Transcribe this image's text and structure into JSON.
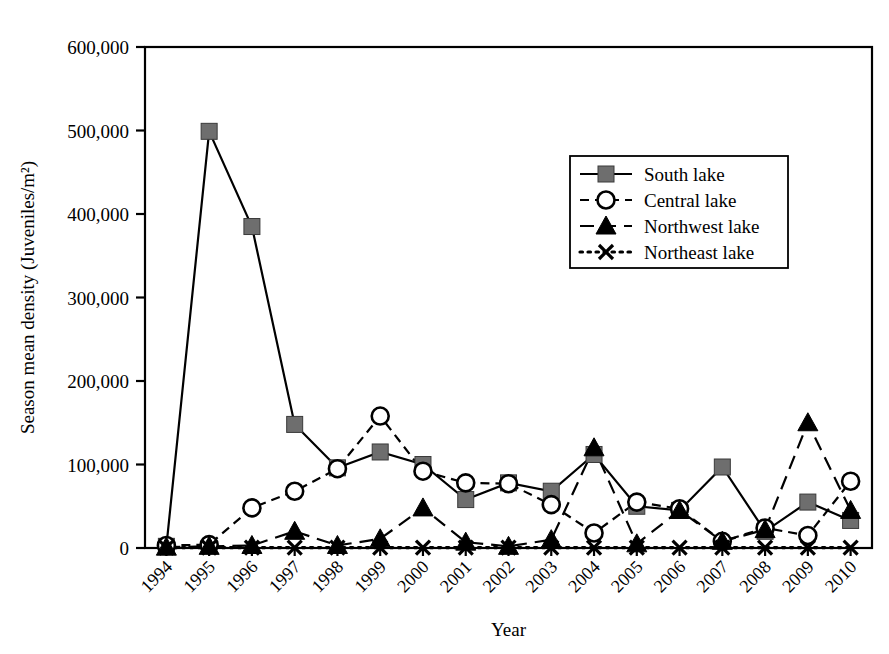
{
  "chart_data": {
    "type": "line",
    "title": "",
    "xlabel": "Year",
    "ylabel": "Season mean density (Juveniles/m²)",
    "categories": [
      "1994",
      "1995",
      "1996",
      "1997",
      "1998",
      "1999",
      "2000",
      "2001",
      "2002",
      "2003",
      "2004",
      "2005",
      "2006",
      "2007",
      "2008",
      "2009",
      "2010"
    ],
    "ylim": [
      0,
      600000
    ],
    "yticks": [
      0,
      100000,
      200000,
      300000,
      400000,
      500000,
      600000
    ],
    "ytick_labels": [
      "0",
      "100,000",
      "200,000",
      "300,000",
      "400,000",
      "500,000",
      "600,000"
    ],
    "grid": false,
    "legend_position": "upper-right-inside",
    "series": [
      {
        "name": "South lake",
        "marker": "filled-square",
        "marker_color": "#6e6e6e",
        "line_style": "solid",
        "line_color": "#000000",
        "values": [
          2000,
          499000,
          385000,
          148000,
          96000,
          115000,
          100000,
          58000,
          78000,
          68000,
          112000,
          50000,
          45000,
          97000,
          20000,
          55000,
          33000
        ]
      },
      {
        "name": "Central lake",
        "marker": "open-circle",
        "marker_color": "#ffffff",
        "line_style": "dashed",
        "line_color": "#000000",
        "values": [
          3000,
          4000,
          48000,
          68000,
          95000,
          158000,
          92000,
          78000,
          77000,
          52000,
          18000,
          55000,
          47000,
          8000,
          24000,
          15000,
          80000
        ]
      },
      {
        "name": "Northwest lake",
        "marker": "filled-triangle",
        "marker_color": "#000000",
        "line_style": "long-dashed",
        "line_color": "#000000",
        "values": [
          1000,
          2000,
          3000,
          20000,
          3000,
          11000,
          48000,
          7000,
          2000,
          10000,
          120000,
          5000,
          45000,
          8000,
          22000,
          150000,
          45000
        ]
      },
      {
        "name": "Northeast lake",
        "marker": "x-cross",
        "marker_color": "#000000",
        "line_style": "dotted",
        "line_color": "#000000",
        "values": [
          500,
          500,
          500,
          500,
          500,
          500,
          500,
          500,
          500,
          500,
          500,
          500,
          500,
          500,
          500,
          500,
          500
        ]
      }
    ]
  },
  "figure": {
    "plot_left": 145,
    "plot_right": 872,
    "plot_top": 47,
    "plot_bottom": 548,
    "frame_color": "#000000"
  }
}
